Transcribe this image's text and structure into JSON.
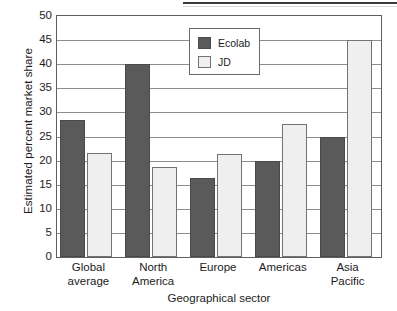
{
  "chart_data": {
    "type": "bar",
    "title": "",
    "subtitle": "",
    "xlabel": "Geographical sector",
    "ylabel": "Estimated percent market share",
    "categories": [
      "Global average",
      "North America",
      "Europe",
      "Americas",
      "Asia Pacific"
    ],
    "category_lines": [
      [
        "Global",
        "average"
      ],
      [
        "North",
        "America"
      ],
      [
        "Europe",
        ""
      ],
      [
        "Americas",
        ""
      ],
      [
        "Asia",
        "Pacific"
      ]
    ],
    "series": [
      {
        "name": "Ecolab",
        "color": "#5a5a5a",
        "values": [
          28.5,
          40.0,
          16.5,
          20.0,
          25.0
        ]
      },
      {
        "name": "JD",
        "color": "#efefef",
        "values": [
          21.5,
          18.7,
          21.3,
          27.5,
          45.0
        ]
      }
    ],
    "ylim": [
      0,
      50
    ],
    "ytick_values": [
      0,
      5,
      10,
      15,
      20,
      25,
      30,
      35,
      40,
      45,
      50
    ],
    "ytick_labels": [
      "0",
      "5",
      "10",
      "15",
      "20",
      "25",
      "30",
      "35",
      "40",
      "45",
      "50"
    ],
    "grid": true,
    "grid_axis": "y",
    "legend": {
      "position": "top-center-inside",
      "entries": [
        {
          "label": "Ecolab",
          "swatch": "dark-gray"
        },
        {
          "label": "JD",
          "swatch": "light-gray"
        }
      ]
    }
  }
}
